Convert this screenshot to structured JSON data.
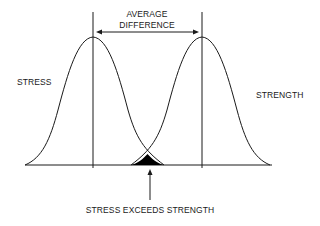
{
  "diagram": {
    "title_line1": "AVERAGE",
    "title_line2": "DIFFERENCE",
    "left_distribution_label": "STRESS",
    "right_distribution_label": "STRENGTH",
    "overlap_label": "STRESS EXCEEDS STRENGTH",
    "colors": {
      "line": "#1a1a1a",
      "overlap_fill": "#000000",
      "background": "#ffffff"
    }
  }
}
